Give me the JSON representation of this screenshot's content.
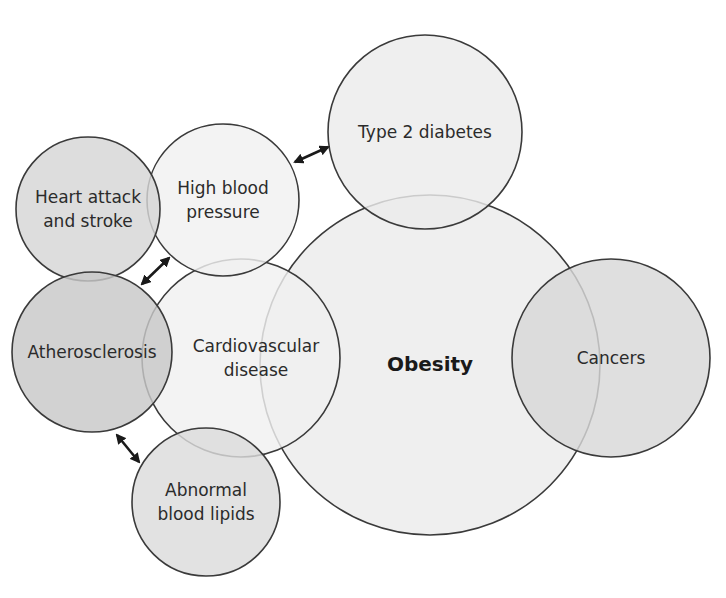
{
  "diagram": {
    "nodes": [
      {
        "id": "obesity",
        "label": "Obesity",
        "lines": [
          "Obesity"
        ],
        "cx": 430,
        "cy": 365,
        "r": 170,
        "fill": "#ececec",
        "bold": true
      },
      {
        "id": "type2-diabetes",
        "label": "Type 2 diabetes",
        "lines": [
          "Type 2 diabetes"
        ],
        "cx": 425,
        "cy": 132,
        "r": 97,
        "fill": "#ececec"
      },
      {
        "id": "cancers",
        "label": "Cancers",
        "lines": [
          "Cancers"
        ],
        "cx": 611,
        "cy": 358,
        "r": 99,
        "fill": "#d8d8d8"
      },
      {
        "id": "cardiovascular-disease",
        "label": "Cardiovascular disease",
        "lines": [
          "Cardiovascular",
          "disease"
        ],
        "cx": 241,
        "cy": 358,
        "r": 99,
        "fill": "#f0f0f0"
      },
      {
        "id": "high-blood-pressure",
        "label": "High blood pressure",
        "lines": [
          "High blood",
          "pressure"
        ],
        "cx": 223,
        "cy": 200,
        "r": 76,
        "fill": "#f0f0f0"
      },
      {
        "id": "heart-attack-and-stroke",
        "label": "Heart attack and stroke",
        "lines": [
          "Heart attack",
          "and stroke"
        ],
        "cx": 88,
        "cy": 209,
        "r": 72,
        "fill": "#d6d6d6"
      },
      {
        "id": "atherosclerosis",
        "label": "Atherosclerosis",
        "lines": [
          "Atherosclerosis"
        ],
        "cx": 92,
        "cy": 352,
        "r": 80,
        "fill": "#c8c8c8"
      },
      {
        "id": "abnormal-blood-lipids",
        "label": "Abnormal blood lipids",
        "lines": [
          "Abnormal",
          "blood lipids"
        ],
        "cx": 206,
        "cy": 502,
        "r": 74,
        "fill": "#dcdcdc"
      }
    ],
    "arrows": [
      {
        "id": "hbp-type2",
        "from": "high-blood-pressure",
        "to": "type2-diabetes",
        "x1": 295,
        "y1": 162,
        "x2": 328,
        "y2": 147,
        "bidirectional": true
      },
      {
        "id": "athero-hbp",
        "from": "atherosclerosis",
        "to": "high-blood-pressure",
        "x1": 142,
        "y1": 284,
        "x2": 169,
        "y2": 258,
        "bidirectional": true
      },
      {
        "id": "athero-lipids",
        "from": "atherosclerosis",
        "to": "abnormal-blood-lipids",
        "x1": 117,
        "y1": 435,
        "x2": 139,
        "y2": 462,
        "bidirectional": true
      }
    ],
    "colors": {
      "stroke": "#3a3a3a",
      "text": "#2b2b2b",
      "background": "#ffffff"
    }
  }
}
